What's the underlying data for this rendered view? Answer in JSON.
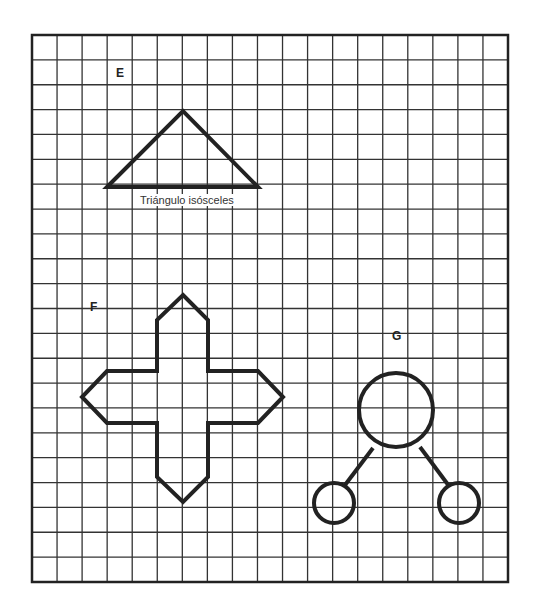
{
  "labels": {
    "E": "E",
    "F": "F",
    "G": "G"
  },
  "caption_E": "Triángulo isósceles",
  "grid": {
    "cols": 19,
    "rows": 22,
    "cell": 25
  },
  "colors": {
    "line": "#222222",
    "grid": "#333333",
    "background": "#ffffff"
  }
}
